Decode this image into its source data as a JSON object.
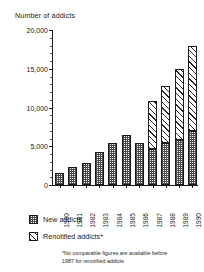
{
  "chart_data": {
    "type": "bar",
    "subtype": "stacked-bar",
    "title": "Number of addicts",
    "xlabel": "",
    "ylabel": "Number of addicts",
    "ylim": [
      0,
      20000
    ],
    "yticks": [
      0,
      5000,
      10000,
      15000,
      20000
    ],
    "ytick_labels": [
      "0",
      "5,000",
      "10,000",
      "15,000",
      "20,000"
    ],
    "ytick_minor_step": 1000,
    "grid": false,
    "legend_position": "below-axes-left",
    "categories": [
      "1980",
      "1981",
      "1982",
      "1983",
      "1984",
      "1985",
      "1986",
      "1987",
      "1988",
      "1989",
      "1990"
    ],
    "series": [
      {
        "name": "New addicts",
        "pattern": "checker",
        "values": [
          1600,
          2300,
          2900,
          4200,
          5400,
          6500,
          5400,
          4700,
          5400,
          5800,
          7000
        ]
      },
      {
        "name": "Renotified addicts*",
        "pattern": "diagonal-hatch",
        "values": [
          0,
          0,
          0,
          0,
          0,
          0,
          0,
          6100,
          7400,
          9200,
          11000
        ]
      }
    ],
    "totals": [
      1600,
      2300,
      2900,
      4200,
      5400,
      6500,
      5400,
      10800,
      12800,
      15000,
      18000
    ],
    "annotations": [
      "*No comparable figures are available before",
      "1987 for renotified addicts"
    ]
  },
  "legend": {
    "items": [
      {
        "label": "New addicts"
      },
      {
        "label": "Renotified addicts*"
      }
    ]
  },
  "footnote": {
    "line1": "*No comparable figures are available before",
    "line2": "1987 for renotified addicts"
  },
  "colors": {
    "axis": "#1a1a1a",
    "new_addicts_fill": "#4a4a4a",
    "renotified_fill": "#2b2b2b",
    "background": "#ffffff"
  }
}
